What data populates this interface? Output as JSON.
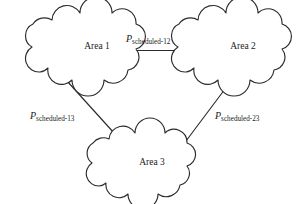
{
  "figure": {
    "type": "network-diagram",
    "background_color": "#ffffff",
    "stroke_color": "#2b2b2b",
    "text_color": "#1b1b1b",
    "nodes": [
      {
        "id": "area1",
        "label": "Area 1",
        "shape": "cloud",
        "cx": 97,
        "cy": 46
      },
      {
        "id": "area2",
        "label": "Area 2",
        "shape": "cloud",
        "cx": 243,
        "cy": 46
      },
      {
        "id": "area3",
        "label": "Area 3",
        "shape": "cloud",
        "cx": 152,
        "cy": 162
      }
    ],
    "links": [
      {
        "id": "link-12",
        "from": "area1",
        "to": "area2",
        "symbol": "P",
        "subscript": "scheduled-12",
        "label_x": 126,
        "label_y": 42
      },
      {
        "id": "link-13",
        "from": "area1",
        "to": "area3",
        "symbol": "P",
        "subscript": "scheduled-13",
        "label_x": 30,
        "label_y": 119
      },
      {
        "id": "link-23",
        "from": "area2",
        "to": "area3",
        "symbol": "P",
        "subscript": "scheduled-23",
        "label_x": 215,
        "label_y": 119
      }
    ]
  }
}
